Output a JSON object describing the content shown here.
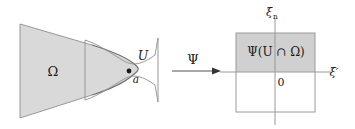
{
  "figure": {
    "background_color": "#ffffff",
    "stroke_color": "#8a8a8a",
    "text_color": "#1a1a1a",
    "fill_omega": "#d9d9d9",
    "fill_image_box": "#d0d0d0",
    "width": 355,
    "height": 129
  },
  "left_panel": {
    "name": "domain-panel",
    "labels": {
      "omega": "Ω",
      "u_neighborhood": "U",
      "point_a": "a"
    },
    "shapes": {
      "omega_region": "shaded cone opening to the left with parabolic right nose",
      "u_region": "unshaded neck/bowtie neighborhood around point a",
      "point_marker": "filled dot at boundary point a"
    }
  },
  "map_arrow": {
    "name": "psi-map-arrow",
    "label": "Ψ",
    "direction": "right"
  },
  "right_panel": {
    "name": "image-panel",
    "labels": {
      "xi_n": "ξ",
      "xi_n_sub": "n",
      "xi_prime": "ξ′",
      "origin": "0",
      "image_set": "Ψ(U ∩ Ω)"
    },
    "shapes": {
      "box": "square coordinate box centered at origin",
      "shaded_half": "upper half of the box is shaded",
      "vertical_axis": "xi_n axis",
      "horizontal_axis": "xi' axis"
    }
  }
}
